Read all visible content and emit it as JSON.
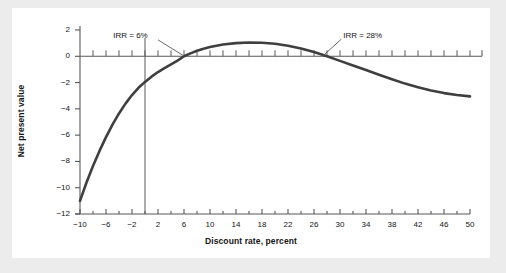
{
  "figure": {
    "background": "#ffffff",
    "page_background": "#ececed",
    "curve_color": "#3f3f3f",
    "axis_color": "#58585a",
    "text_color": "#141414"
  },
  "chart_data": {
    "type": "line",
    "title": "",
    "xlabel": "Discount rate, percent",
    "ylabel": "Net present value",
    "xlim": [
      -10,
      50
    ],
    "ylim": [
      -12,
      2
    ],
    "grid": false,
    "legend": null,
    "xticks": [
      -10,
      -6,
      -2,
      2,
      6,
      10,
      14,
      18,
      22,
      26,
      30,
      34,
      38,
      42,
      46,
      50
    ],
    "xtick_labels": [
      "−10",
      "−6",
      "−2",
      "2",
      "6",
      "10",
      "14",
      "18",
      "22",
      "26",
      "30",
      "34",
      "38",
      "42",
      "46",
      "50"
    ],
    "x_minor_step": 2,
    "yticks": [
      2,
      0,
      -2,
      -4,
      -6,
      -8,
      -10,
      -12
    ],
    "ytick_labels": [
      "2",
      "0",
      "−2",
      "−4",
      "−6",
      "−8",
      "−10",
      "−12"
    ],
    "series": [
      {
        "name": "Net present value",
        "x": [
          -10,
          -9,
          -8,
          -7,
          -6,
          -5,
          -4,
          -3,
          -2,
          -1,
          0,
          1,
          2,
          3,
          4,
          5,
          6,
          7,
          8,
          9,
          10,
          12,
          14,
          16,
          18,
          20,
          22,
          24,
          26,
          28,
          30,
          32,
          34,
          36,
          38,
          40,
          42,
          44,
          46,
          48,
          50
        ],
        "y": [
          -11.0,
          -9.6,
          -8.35,
          -7.2,
          -6.15,
          -5.2,
          -4.35,
          -3.6,
          -2.95,
          -2.4,
          -1.95,
          -1.55,
          -1.2,
          -0.9,
          -0.62,
          -0.33,
          0.0,
          0.22,
          0.42,
          0.58,
          0.7,
          0.9,
          1.0,
          1.05,
          1.03,
          0.95,
          0.8,
          0.6,
          0.33,
          0.0,
          -0.35,
          -0.7,
          -1.05,
          -1.4,
          -1.75,
          -2.08,
          -2.35,
          -2.6,
          -2.8,
          -2.95,
          -3.05
        ]
      }
    ],
    "reference_lines": [
      {
        "name": "zero-npv-line",
        "orientation": "horizontal",
        "value": 0
      },
      {
        "name": "zero-rate-line",
        "orientation": "vertical",
        "value": 0
      }
    ],
    "annotations": [
      {
        "name": "irr-low",
        "text": "IRR = 6%",
        "x": 6,
        "y": 0,
        "label_x": -1.5,
        "label_y": 1.55
      },
      {
        "name": "irr-high",
        "text": "IRR = 28%",
        "x": 28,
        "y": 0,
        "label_x": 30.5,
        "label_y": 1.55
      }
    ]
  }
}
